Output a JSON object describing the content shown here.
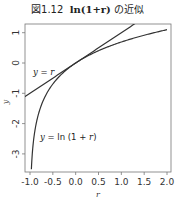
{
  "title": {
    "prefix": "図1.12",
    "expr": "ln(1+r)",
    "suffix": "の近似"
  },
  "chart_data": {
    "type": "line",
    "xlabel": "r",
    "ylabel": "y",
    "xlim": [
      -1.1,
      2.1
    ],
    "ylim": [
      -3.6,
      1.3
    ],
    "grid": false,
    "legend": null,
    "x_ticks": [
      -1.0,
      -0.5,
      0.0,
      0.5,
      1.0,
      1.5,
      2.0
    ],
    "x_tick_labels": [
      "-1.0",
      "-0.5",
      "0.0",
      "0.5",
      "1.0",
      "1.5",
      "2.0"
    ],
    "y_ticks": [
      -3,
      -2,
      -1,
      0,
      1
    ],
    "y_tick_labels": [
      "-3",
      "-2",
      "-1",
      "0",
      "1"
    ],
    "series": [
      {
        "name": "y = r",
        "function": "r",
        "x": [
          -1.1,
          -0.5,
          0.0,
          0.5,
          1.0,
          1.3
        ],
        "y": [
          -1.1,
          -0.5,
          0.0,
          0.5,
          1.0,
          1.3
        ]
      },
      {
        "name": "y = ln(1+r)",
        "function": "ln(1+r)",
        "x": [
          -0.97,
          -0.9,
          -0.8,
          -0.6,
          -0.4,
          -0.2,
          0.0,
          0.25,
          0.5,
          1.0,
          1.5,
          2.0
        ],
        "y": [
          -3.51,
          -2.3,
          -1.61,
          -0.92,
          -0.51,
          -0.22,
          0.0,
          0.22,
          0.41,
          0.69,
          0.92,
          1.1
        ]
      }
    ],
    "annotations": [
      {
        "text": "y = r",
        "x": -0.95,
        "y": -0.3
      },
      {
        "text": "y = ln (1 + r)",
        "x": -0.75,
        "y": -2.5
      }
    ]
  }
}
